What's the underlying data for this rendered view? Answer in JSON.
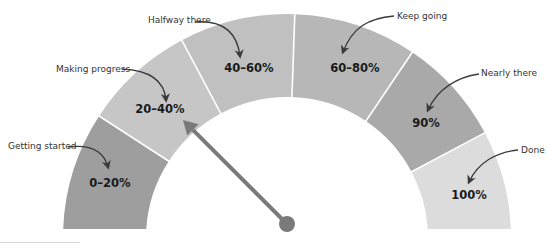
{
  "diagram": {
    "type": "progress-gauge",
    "center": [
      287,
      238
    ],
    "outer_radius": 224,
    "inner_radius": 141,
    "bottom_y": 229,
    "segments": [
      {
        "label": "0–20%",
        "callout": "Getting started",
        "from_deg": 180,
        "to_deg": 147,
        "color": "#9e9e9e",
        "label_pos": [
          110,
          187
        ],
        "callout_pos": [
          8,
          149
        ],
        "arrow": "M 68 147 C 92 144, 104 152, 108 167"
      },
      {
        "label": "20–40%",
        "callout": "Making progress",
        "from_deg": 147,
        "to_deg": 118,
        "color": "#c6c6c6",
        "label_pos": [
          160,
          113
        ],
        "callout_pos": [
          56,
          72
        ],
        "arrow": "M 122 69 C 145 70, 164 78, 166 100"
      },
      {
        "label": "40–60%",
        "callout": "Halfway there",
        "from_deg": 118,
        "to_deg": 88,
        "color": "#c0c0c0",
        "label_pos": [
          249,
          72
        ],
        "callout_pos": [
          148,
          23
        ],
        "arrow": "M 195 22 C 222 20, 237 32, 240 56"
      },
      {
        "label": "60–80%",
        "callout": "Keep going",
        "from_deg": 88,
        "to_deg": 56,
        "color": "#b7b7b7",
        "label_pos": [
          355,
          72
        ],
        "callout_pos": [
          397,
          19
        ],
        "arrow": "M 394 16 C 368 18, 352 28, 343 52"
      },
      {
        "label": "90%",
        "callout": "Nearly there",
        "from_deg": 56,
        "to_deg": 28,
        "color": "#a9a9a9",
        "label_pos": [
          426,
          127
        ],
        "callout_pos": [
          481,
          76
        ],
        "arrow": "M 479 74 C 458 77, 438 88, 428 110"
      },
      {
        "label": "100%",
        "callout": "Done",
        "from_deg": 28,
        "to_deg": 0,
        "color": "#dcdcdc",
        "label_pos": [
          469,
          199
        ],
        "callout_pos": [
          521,
          153
        ],
        "arrow": "M 518 150 C 497 152, 478 162, 469 182"
      }
    ],
    "divider_color": "#ffffff",
    "needle": {
      "pivot": [
        287,
        224
      ],
      "pivot_radius": 8,
      "tip": [
        183,
        120
      ],
      "color": "#7a7a7a"
    },
    "arrow_color": "#3a3a3a"
  }
}
